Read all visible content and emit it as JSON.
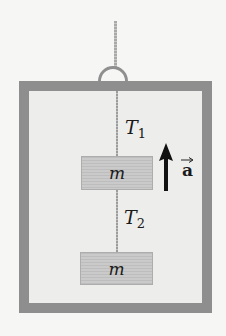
{
  "diagram": {
    "type": "physics-free-body",
    "labels": {
      "tension_upper": {
        "symbol": "T",
        "subscript": "1"
      },
      "tension_lower": {
        "symbol": "T",
        "subscript": "2"
      },
      "mass_upper": "m",
      "mass_lower": "m",
      "acceleration": "a"
    },
    "acceleration_direction": "up",
    "colors": {
      "frame": "#8e8e8e",
      "interior": "#ededeb",
      "block": "#c4c4c4",
      "arrow": "#111111",
      "background": "#f6f6f4"
    }
  }
}
